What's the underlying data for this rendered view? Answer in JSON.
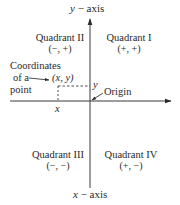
{
  "diagram": {
    "type": "cartesian-plane",
    "axes": {
      "y_axis_label_var": "y",
      "y_axis_label_rest": " − axis",
      "x_axis_label_var": "x",
      "x_axis_label_rest": " − axis"
    },
    "quadrants": [
      {
        "name": "Quadrant I",
        "signs": "(+, +)"
      },
      {
        "name": "Quadrant II",
        "signs": "(−, +)"
      },
      {
        "name": "Quadrant III",
        "signs": "(−, −)"
      },
      {
        "name": "Quadrant IV",
        "signs": "(+, −)"
      }
    ],
    "point": {
      "callout_line1": "Coordinates",
      "callout_line2": "of a",
      "callout_line3": "point",
      "coords": "(x, y)",
      "x_tick": "x",
      "y_tick": "y"
    },
    "origin_label": "Origin",
    "colors": {
      "line": "#3a3a3a",
      "text": "#2a2a2a",
      "background": "#ffffff"
    }
  }
}
